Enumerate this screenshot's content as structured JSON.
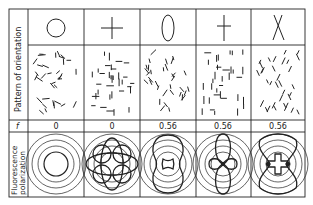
{
  "figure": {
    "row_labels": {
      "pattern": "Pattern of orientation",
      "f": "f",
      "polarization_line1": "Fluorescence",
      "polarization_line2": "polarization"
    },
    "columns": [
      {
        "symbol": "circle",
        "symbol_name": "isotropic",
        "f": "0",
        "pattern": "random",
        "polar": "concentric-circles"
      },
      {
        "symbol": "plus",
        "symbol_name": "cross",
        "f": "0",
        "pattern": "orthogonal",
        "polar": "four-lobe"
      },
      {
        "symbol": "ellipse",
        "symbol_name": "vertical-ellipse",
        "f": "0.56",
        "pattern": "vertical-random",
        "polar": "vertical-peanut"
      },
      {
        "symbol": "dagger",
        "symbol_name": "vertical-cross",
        "f": "0.56",
        "pattern": "vertical-orthogonal",
        "polar": "vertical-clover"
      },
      {
        "symbol": "x",
        "symbol_name": "x-cross",
        "f": "0.56",
        "pattern": "diagonal",
        "polar": "hourglass-with-cross"
      }
    ],
    "colors": {
      "line": "#222222",
      "background": "#ffffff"
    }
  }
}
